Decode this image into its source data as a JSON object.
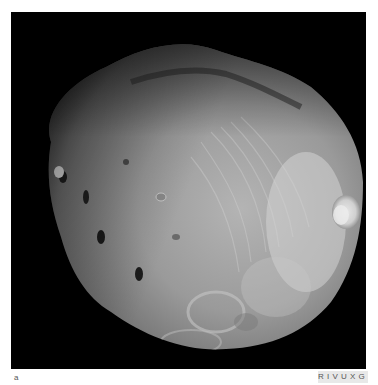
{
  "figure": {
    "panel_label": "a",
    "band_badge": "RIVUXG",
    "colors": {
      "background": "#000000",
      "surface_light": "#c8c8c8",
      "surface_mid": "#8a8a8a",
      "surface_dark": "#3a3a3a",
      "badge_bg": "#e8e8e8",
      "badge_text": "#555555"
    }
  }
}
